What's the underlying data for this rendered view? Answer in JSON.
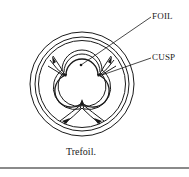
{
  "figure": {
    "caption": "Trefoil.",
    "labels": {
      "foil": "FOIL",
      "cusp": "CUSP"
    }
  }
}
